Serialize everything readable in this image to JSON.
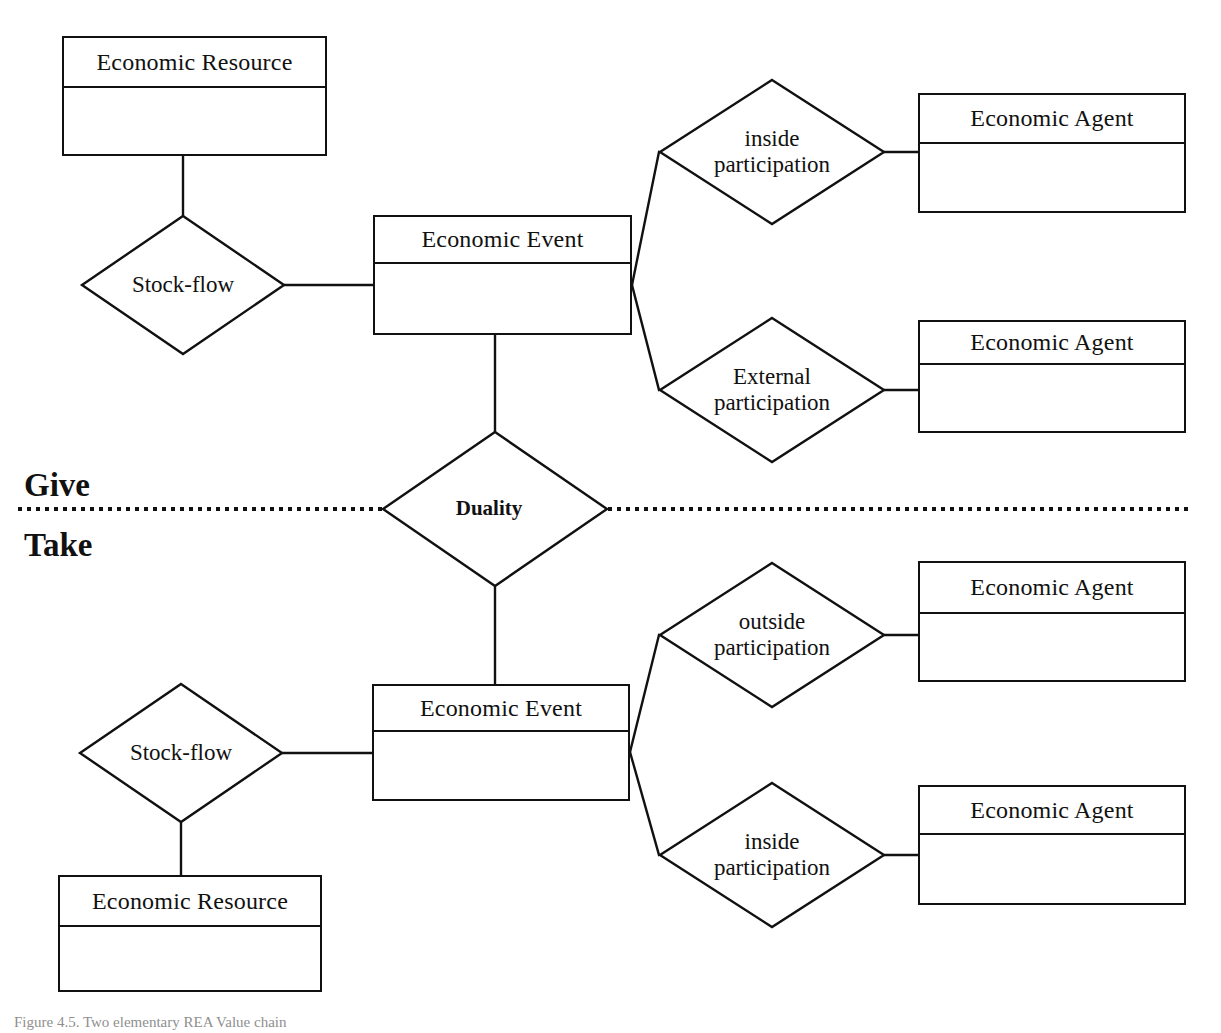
{
  "diagram": {
    "stroke_color": "#111111",
    "background_color": "#ffffff",
    "divider_label": {
      "give": "Give",
      "take": "Take"
    },
    "caption": "Figure 4.5. Two elementary REA Value chain"
  },
  "entities": [
    {
      "id": "economic-resource-top",
      "name": "Economic Resource",
      "x": 62,
      "y": 36,
      "w": 265,
      "h": 120,
      "header_h": 50
    },
    {
      "id": "economic-event-give",
      "name": "Economic Event",
      "x": 373,
      "y": 215,
      "w": 259,
      "h": 120,
      "header_h": 47
    },
    {
      "id": "economic-agent-inside-give",
      "name": "Economic Agent",
      "x": 918,
      "y": 93,
      "w": 268,
      "h": 120,
      "header_h": 49
    },
    {
      "id": "economic-agent-external-give",
      "name": "Economic Agent",
      "x": 918,
      "y": 320,
      "w": 268,
      "h": 113,
      "header_h": 43
    },
    {
      "id": "economic-event-take",
      "name": "Economic Event",
      "x": 372,
      "y": 684,
      "w": 258,
      "h": 117,
      "header_h": 46
    },
    {
      "id": "economic-agent-outside-take",
      "name": "Economic Agent",
      "x": 918,
      "y": 561,
      "w": 268,
      "h": 121,
      "header_h": 51
    },
    {
      "id": "economic-agent-inside-take",
      "name": "Economic Agent",
      "x": 918,
      "y": 785,
      "w": 268,
      "h": 120,
      "header_h": 48
    },
    {
      "id": "economic-resource-bottom",
      "name": "Economic Resource",
      "x": 58,
      "y": 875,
      "w": 264,
      "h": 117,
      "header_h": 50
    }
  ],
  "relationships": [
    {
      "id": "stock-flow-give",
      "label_lines": [
        "Stock-flow"
      ],
      "cx": 183,
      "cy": 285,
      "rx": 102,
      "ry": 70,
      "bold": false
    },
    {
      "id": "inside-participation-give",
      "label_lines": [
        "inside",
        "participation"
      ],
      "cx": 772,
      "cy": 152,
      "rx": 113,
      "ry": 73,
      "bold": false
    },
    {
      "id": "external-participation-give",
      "label_lines": [
        "External",
        "participation"
      ],
      "cx": 772,
      "cy": 390,
      "rx": 113,
      "ry": 73,
      "bold": false
    },
    {
      "id": "duality",
      "label_lines": [
        "Duality"
      ],
      "cx": 495,
      "cy": 509,
      "rx": 113,
      "ry": 78,
      "bold": true
    },
    {
      "id": "outside-participation-take",
      "label_lines": [
        "outside",
        "participation"
      ],
      "cx": 772,
      "cy": 635,
      "rx": 113,
      "ry": 73,
      "bold": false
    },
    {
      "id": "inside-participation-take",
      "label_lines": [
        "inside",
        "participation"
      ],
      "cx": 772,
      "cy": 855,
      "rx": 113,
      "ry": 73,
      "bold": false
    },
    {
      "id": "stock-flow-take",
      "label_lines": [
        "Stock-flow"
      ],
      "cx": 181,
      "cy": 753,
      "rx": 102,
      "ry": 70,
      "bold": false
    }
  ],
  "connectors": [
    {
      "id": "resource-top-to-stockflow",
      "points": "183,156 183,215"
    },
    {
      "id": "stockflow-to-event-give",
      "points": "285,285 373,285"
    },
    {
      "id": "event-give-to-inside",
      "points": "632,285 659,152"
    },
    {
      "id": "inside-to-agent-give",
      "points": "885,152 918,152"
    },
    {
      "id": "event-give-to-external",
      "points": "632,285 659,390"
    },
    {
      "id": "external-to-agent-give",
      "points": "885,390 918,390"
    },
    {
      "id": "event-give-to-duality",
      "points": "495,335 495,431"
    },
    {
      "id": "duality-to-event-take",
      "points": "495,587 495,684"
    },
    {
      "id": "event-take-to-outside",
      "points": "630,752 659,635"
    },
    {
      "id": "outside-to-agent-take",
      "points": "885,635 918,635"
    },
    {
      "id": "event-take-to-inside",
      "points": "630,752 659,855"
    },
    {
      "id": "inside-to-agent-take",
      "points": "885,855 918,855"
    },
    {
      "id": "stockflow-take-to-event",
      "points": "283,753 372,753"
    },
    {
      "id": "stockflow-take-to-resource",
      "points": "181,823 181,875"
    }
  ],
  "dotted_divider": {
    "id": "give-take-divider",
    "y": 509,
    "left_x_start": 18,
    "left_x_end": 382,
    "right_x_start": 608,
    "right_x_end": 1192
  }
}
